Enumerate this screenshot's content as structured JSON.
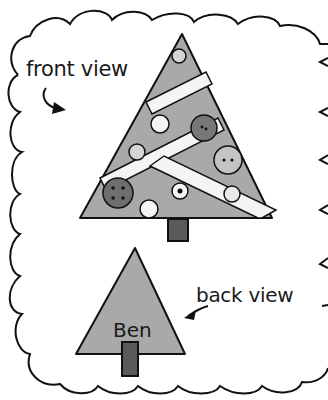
{
  "labels": {
    "front": "front view",
    "back": "back view",
    "name": "Ben"
  },
  "colors": {
    "tree": "#a9a9a9",
    "trunk": "#5a5a5a",
    "ribbon": "#f4f4f4",
    "button_dark": "#707070",
    "outline": "#111111",
    "background": "#ffffff"
  }
}
